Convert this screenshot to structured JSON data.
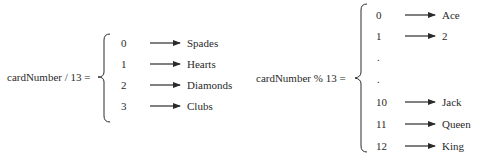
{
  "left": {
    "expression": "cardNumber / 13 =",
    "rows": [
      {
        "value": "0",
        "label": "Spades"
      },
      {
        "value": "1",
        "label": "Hearts"
      },
      {
        "value": "2",
        "label": "Diamonds"
      },
      {
        "value": "3",
        "label": "Clubs"
      }
    ]
  },
  "right": {
    "expression": "cardNumber % 13 =",
    "rows": [
      {
        "value": "0",
        "label": "Ace"
      },
      {
        "value": "1",
        "label": "2"
      },
      {
        "value": ".",
        "label": ""
      },
      {
        "value": ".",
        "label": ""
      },
      {
        "value": "10",
        "label": "Jack"
      },
      {
        "value": "11",
        "label": "Queen"
      },
      {
        "value": "12",
        "label": "King"
      }
    ]
  },
  "colors": {
    "ink": "#2a2a2a",
    "background": "#ffffff"
  }
}
